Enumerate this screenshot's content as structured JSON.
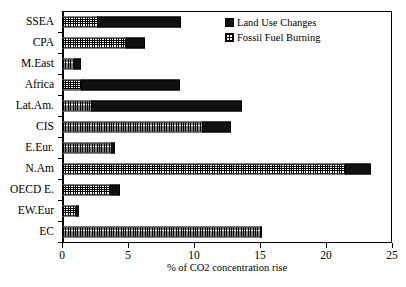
{
  "chart_data": {
    "type": "bar",
    "orientation": "horizontal",
    "title": "",
    "xlabel": "% of CO2 concentration rise",
    "ylabel": "",
    "xlim": [
      0,
      25
    ],
    "xticks": [
      0,
      5,
      10,
      15,
      20,
      25
    ],
    "grid": false,
    "legend_position": "top-right",
    "stacked": true,
    "categories": [
      "SSEA",
      "CPA",
      "M.East",
      "Africa",
      "Lat.Am.",
      "CIS",
      "E.Eur.",
      "N.Am",
      "OECD E.",
      "EW.Eur",
      "EC"
    ],
    "series": [
      {
        "name": "Fossil Fuel Burning",
        "values": [
          2.7,
          4.9,
          1.0,
          1.5,
          2.3,
          10.7,
          3.8,
          21.5,
          3.7,
          1.1,
          15.1
        ]
      },
      {
        "name": "Land Use Changes",
        "values": [
          6.4,
          1.5,
          0.5,
          7.5,
          11.4,
          2.2,
          0.3,
          2.0,
          0.8,
          0.3,
          0.1
        ]
      }
    ],
    "totals": [
      9.1,
      6.4,
      1.5,
      9.0,
      13.7,
      12.9,
      4.1,
      23.5,
      4.5,
      1.4,
      15.2
    ]
  },
  "legend": {
    "items": [
      {
        "label": "Land Use Changes",
        "swatch": "solid-black"
      },
      {
        "label": "Fossil Fuel Burning",
        "swatch": "hatched"
      }
    ]
  },
  "axis": {
    "x_tick_labels": [
      "0",
      "5",
      "10",
      "15",
      "20",
      "25"
    ],
    "x_title": "% of CO2 concentration rise"
  },
  "colors": {
    "land_use": "#111111",
    "fossil_fuel": "#000000",
    "background": "#ffffff",
    "axis": "#000000"
  }
}
